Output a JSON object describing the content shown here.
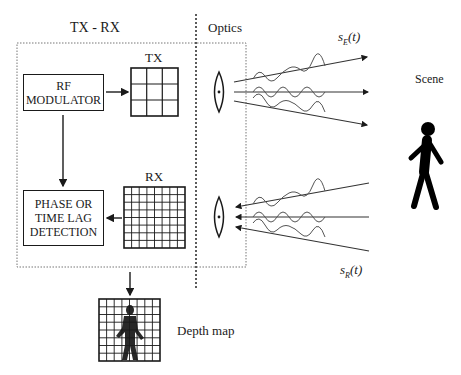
{
  "sections": {
    "txrx_title": "TX - RX",
    "optics_title": "Optics",
    "scene_title": "Scene"
  },
  "blocks": {
    "rf_modulator": {
      "line1": "RF",
      "line2": "MODULATOR"
    },
    "phase_detection": {
      "line1": "PHASE OR",
      "line2": "TIME LAG",
      "line3": "DETECTION"
    },
    "tx_array": {
      "label": "TX",
      "rows": 3,
      "cols": 3
    },
    "rx_array": {
      "label": "RX",
      "rows": 8,
      "cols": 8
    },
    "depth_map": {
      "label": "Depth map",
      "rows": 8,
      "cols": 8
    }
  },
  "signals": {
    "emitted": {
      "symbol": "s",
      "subscript": "E",
      "arg": "(t)"
    },
    "received": {
      "symbol": "s",
      "subscript": "R",
      "arg": "(t)"
    }
  },
  "colors": {
    "stroke": "#1a1a1a",
    "wave": "#555555",
    "dotted": "#777777"
  }
}
